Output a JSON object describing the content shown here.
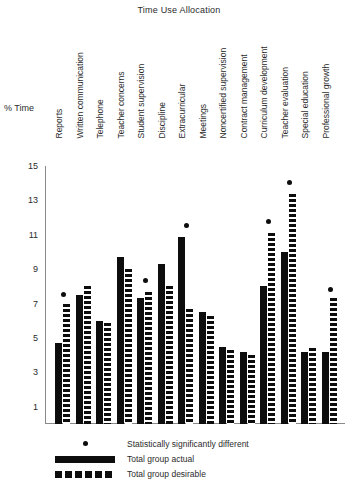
{
  "chart_data": {
    "type": "bar",
    "title": "Time Use Allocation",
    "xlabel": "",
    "ylabel": "% Time",
    "ylim": [
      0,
      15
    ],
    "yticks": [
      1,
      3,
      5,
      7,
      9,
      11,
      13,
      15
    ],
    "grid": false,
    "legend_position": "bottom-left",
    "categories": [
      "Reports",
      "Written communication",
      "Telephone",
      "Teacher concerns",
      "Student supervision",
      "Discipline",
      "Extracurricular",
      "Meetings",
      "Noncertified supervision",
      "Contract management",
      "Curriculum development",
      "Teacher evaluation",
      "Special education",
      "Professional growth"
    ],
    "series": [
      {
        "name": "Total group actual",
        "style": "solid",
        "values": [
          4.7,
          7.5,
          6.0,
          9.7,
          7.3,
          9.3,
          10.9,
          6.5,
          4.5,
          4.2,
          8.0,
          10.0,
          4.2,
          4.2
        ]
      },
      {
        "name": "Total group desirable",
        "style": "dashed",
        "values": [
          7.0,
          8.0,
          5.9,
          9.0,
          7.7,
          8.0,
          6.7,
          6.3,
          4.3,
          4.0,
          11.1,
          13.4,
          4.4,
          7.3
        ]
      }
    ],
    "significance_markers": {
      "name": "Statistically significantly different",
      "categories": [
        "Reports",
        "Student supervision",
        "Extracurricular",
        "Curriculum development",
        "Teacher evaluation",
        "Professional growth"
      ],
      "values": [
        7.4,
        8.2,
        11.4,
        11.6,
        13.9,
        7.7
      ]
    }
  },
  "legend": {
    "items": [
      {
        "label": "Statistically significantly different",
        "key": "dot"
      },
      {
        "label": "Total group actual",
        "key": "solid"
      },
      {
        "label": "Total group desirable",
        "key": "dashed"
      }
    ]
  },
  "colors": {
    "ink": "#0d0d0d",
    "axis": "#8a8a8a",
    "text": "#2b2b2b",
    "background": "#ffffff"
  }
}
